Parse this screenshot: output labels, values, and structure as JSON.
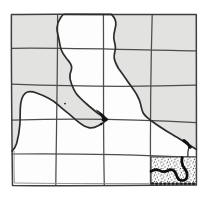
{
  "figure": {
    "canvas": {
      "width": 209,
      "height": 199
    },
    "grid": {
      "columns": 4,
      "rows": 5
    },
    "colors": {
      "page": "#ffffff",
      "shading": "#e2e2e0",
      "region_fill": "#fdfdfd",
      "grid_line": "#4c4c4c",
      "border_line": "#3e3e3e",
      "faint_line": "#8a8a8a",
      "outline": "#2c2c2c",
      "ink": "#111111",
      "stipple_dot": "#1c1c1c"
    },
    "stipple_pattern": {
      "tile": 6.5,
      "dots": [
        [
          1.2,
          1.8,
          0.6
        ],
        [
          4.4,
          0.9,
          0.5
        ],
        [
          5.9,
          3.4,
          0.6
        ],
        [
          2.6,
          4.6,
          0.55
        ],
        [
          5.1,
          5.9,
          0.6
        ],
        [
          0.7,
          6.1,
          0.45
        ]
      ]
    },
    "layers": [
      {
        "name": "shaded-background",
        "tag": "path",
        "attrs": {
          "d": "M 11.4 14.6 C 60 13.7 150 15.1 196.3 14.4 C 196.8 60 196.5 125 196.4 185.1 C 135 185.5 60 186 12.5 185.4 C 11.8 128 11.2 70 11.4 14.6 Z",
          "fill": "#e2e2e0",
          "stroke": "none"
        }
      },
      {
        "name": "region-fill",
        "tag": "path",
        "attrs": {
          "d": "M 64 14.3 C 71 14.3 104 14.4 111.5 14.4 C 113.5 16.5 116.5 20.5 115.8 25 C 115.2 29.5 113.5 33.5 113.8 38 C 114.1 42 115.8 45 115.4 48.5 C 115 52 113.8 54.5 114.2 58 C 114.8 62 116.5 65 118.5 68.5 C 121.5 72.5 125 77.5 128.8 83 C 132 87.5 135.2 91.8 137.2 95.5 C 139 98.8 140.2 101.8 140.8 104.8 C 141.4 107.8 141.6 110.3 143.2 113 C 145.4 116.6 147.8 118.1 152 121.3 C 157 125.1 162.2 128.4 167.2 131.5 C 172 134.4 176.7 137 181 139.8 C 185 142.4 190.7 146 196.5 149.4 L 196.4 185.1 L 12.5 185.4 L 12.1 151.2 C 13.6 149.6 15.6 146.6 16.7 143.2 C 18.3 137.6 19.4 130.6 19.9 124.2 C 20.3 118.6 20.1 112.6 20.3 108.4 C 20.5 102.4 21.9 95.9 25.4 93.1 C 28.6 90.6 32.6 91.6 36.6 93 C 40.6 94.4 44.6 96.2 48.6 98.2 C 52.2 100 55.7 102.6 58.7 105.4 C 61.2 107.7 63.7 109.8 66.7 112.1 C 70.7 115.1 74.3 118.6 78.3 121.8 C 81.9 124.6 85.4 127 88.9 127.7 C 92.4 128.4 95.6 127.2 98.6 125.5 C 101.6 123.7 104.9 121.7 107.7 119.4 C 104.9 118 101.6 116 98.6 113.8 C 94.6 110.8 90.1 107 86.1 103.5 C 82.6 100.4 78.7 97 76.2 93.5 C 74 90.4 72.7 87.2 71.5 84 C 70.4 81 69.5 77.7 70 74.5 C 70.5 71.8 72.1 69.5 71.6 66.5 C 71.1 63.4 68.7 61.2 66.7 58.7 C 64.5 56 62.2 52.7 61 49.2 C 59.8 45.6 59.5 41.7 58.6 37.7 C 57.9 34.5 56.7 31.2 57 27.7 C 57.3 24.2 59.1 19.7 60.9 17.2 C 61.9 15.8 63 14.6 64 14.3 Z",
          "fill": "#fdfdfd",
          "stroke": "none"
        }
      },
      {
        "name": "grid-line-vertical-1",
        "tag": "path",
        "attrs": {
          "d": "M 57.6 14.4 C 57.7 70 56.2 140 55.8 185.2",
          "fill": "none",
          "stroke": "#4c4c4c",
          "stroke-width": "1.25"
        }
      },
      {
        "name": "grid-line-vertical-2",
        "tag": "path",
        "attrs": {
          "d": "M 103.4 14.4 C 103.8 62 103 132 104.3 185.1",
          "fill": "none",
          "stroke": "#4c4c4c",
          "stroke-width": "1.25"
        }
      },
      {
        "name": "grid-line-vertical-3",
        "tag": "path",
        "attrs": {
          "d": "M 152.2 14.6 C 150.9 62 150.2 122 150.5 185",
          "fill": "none",
          "stroke": "#4c4c4c",
          "stroke-width": "1.25"
        }
      },
      {
        "name": "grid-line-horizontal-1",
        "tag": "path",
        "attrs": {
          "d": "M 11.5 48.3 C 70 47.5 140 50.2 196.4 50.9",
          "fill": "none",
          "stroke": "#4c4c4c",
          "stroke-width": "1.25"
        }
      },
      {
        "name": "grid-line-horizontal-2",
        "tag": "path",
        "attrs": {
          "d": "M 11.4 84.2 C 70 86.4 140 87 196.4 85.2",
          "fill": "none",
          "stroke": "#4c4c4c",
          "stroke-width": "1.25"
        }
      },
      {
        "name": "grid-line-horizontal-3",
        "tag": "path",
        "attrs": {
          "d": "M 11.4 120.2 C 65 118.3 125 118.4 196.4 122.6",
          "fill": "none",
          "stroke": "#4c4c4c",
          "stroke-width": "1.25"
        }
      },
      {
        "name": "grid-line-horizontal-4",
        "tag": "path",
        "attrs": {
          "d": "M 11.5 154 C 70 153.3 130 154.6 196.4 157.3",
          "fill": "none",
          "stroke": "#4c4c4c",
          "stroke-width": "1.25"
        }
      },
      {
        "name": "map-border",
        "tag": "path",
        "attrs": {
          "d": "M 11.4 14.6 C 60 13.7 150 15.1 196.3 14.4 C 196.8 60 196.5 125 196.4 185.1 C 135 185.5 60 186 12.5 185.4 C 11.8 128 11.2 70 11.4 14.6 Z",
          "fill": "none",
          "stroke": "#3e3e3e",
          "stroke-width": "1.5",
          "stroke-linejoin": "round"
        }
      },
      {
        "name": "map-border-double-stroke",
        "tag": "path",
        "attrs": {
          "d": "M 14.1 151 C 13.9 163 14 174 14.4 183 C 58 183.8 105 183.4 149.5 183.6",
          "fill": "none",
          "stroke": "#8a8a8a",
          "stroke-width": "0.9"
        }
      },
      {
        "name": "region-outline",
        "tag": "path",
        "attrs": {
          "d": "M 64 14.3 C 71 14.3 104 14.4 111.5 14.4 C 113.5 16.5 116.5 20.5 115.8 25 C 115.2 29.5 113.5 33.5 113.8 38 C 114.1 42 115.8 45 115.4 48.5 C 115 52 113.8 54.5 114.2 58 C 114.8 62 116.5 65 118.5 68.5 C 121.5 72.5 125 77.5 128.8 83 C 132 87.5 135.2 91.8 137.2 95.5 C 139 98.8 140.2 101.8 140.8 104.8 C 141.4 107.8 141.6 110.3 143.2 113 C 145.4 116.6 147.8 118.1 152 121.3 C 157 125.1 162.2 128.4 167.2 131.5 C 172 134.4 176.7 137 181 139.8 C 185 142.4 190.7 146 196.5 149.4 M 12.1 151.2 C 13.6 149.6 15.6 146.6 16.7 143.2 C 18.3 137.6 19.4 130.6 19.9 124.2 C 20.3 118.6 20.1 112.6 20.3 108.4 C 20.5 102.4 21.9 95.9 25.4 93.1 C 28.6 90.6 32.6 91.6 36.6 93 C 40.6 94.4 44.6 96.2 48.6 98.2 C 52.2 100 55.7 102.6 58.7 105.4 C 61.2 107.7 63.7 109.8 66.7 112.1 C 70.7 115.1 74.3 118.6 78.3 121.8 C 81.9 124.6 85.4 127 88.9 127.7 C 92.4 128.4 95.6 127.2 98.6 125.5 C 101.6 123.7 104.9 121.7 107.7 119.4 C 104.9 118 101.6 116 98.6 113.8 C 94.6 110.8 90.1 107 86.1 103.5 C 82.6 100.4 78.7 97 76.2 93.5 C 74 90.4 72.7 87.2 71.5 84 C 70.4 81 69.5 77.7 70 74.5 C 70.5 71.8 72.1 69.5 71.6 66.5 C 71.1 63.4 68.7 61.2 66.7 58.7 C 64.5 56 62.2 52.7 61 49.2 C 59.8 45.6 59.5 41.7 58.6 37.7 C 57.9 34.5 56.7 31.2 57 27.7 C 57.3 24.2 59.1 19.7 60.9 17.2 C 61.9 15.8 63 14.6 64 14.3",
          "fill": "none",
          "stroke": "#2c2c2c",
          "stroke-width": "1.7",
          "stroke-linejoin": "round",
          "stroke-linecap": "round"
        }
      },
      {
        "name": "stipple-cell-underlay",
        "tag": "rect",
        "attrs": {
          "x": "151",
          "y": "156.9",
          "width": "45.3",
          "height": "26.9",
          "fill": "#ffffff",
          "stroke": "none"
        }
      },
      {
        "name": "stipple-cell-dots",
        "tag": "rect",
        "attrs": {
          "x": "151",
          "y": "156.9",
          "width": "45.3",
          "height": "26.9",
          "fill": "url(#stipple)",
          "stroke": "none"
        }
      },
      {
        "name": "stipple-cell-outline",
        "tag": "rect",
        "attrs": {
          "x": "151",
          "y": "156.9",
          "width": "45.3",
          "height": "26.9",
          "fill": "none",
          "stroke": "#3f3f3f",
          "stroke-width": "1.1"
        }
      },
      {
        "name": "channel-squiggle",
        "tag": "path",
        "attrs": {
          "d": "M 151 171.4 C 154 169.2 157 169 160 170.6 C 162.5 171.9 165 172 167.5 170.7 C 169.8 169.5 172.2 169.3 174.1 170.9 C 175.9 172.4 176.3 174.8 177.2 177 C 178.1 179.2 180.2 180.6 182.6 180.5 C 185.1 180.4 186.8 178.6 187.1 176.1 C 187.4 173.4 186.2 170.6 184.5 168.4 C 183.1 166.5 182.1 164.3 181.9 162 C 181.7 160.5 181.9 159 182.1 157.7",
          "fill": "none",
          "stroke": "#0d0d0d",
          "stroke-width": "2.7",
          "stroke-linecap": "round",
          "stroke-linejoin": "round"
        }
      },
      {
        "name": "stipple-cell-bottom-band",
        "tag": "path",
        "attrs": {
          "d": "M 151.2 183.4 C 166 184 181 183.4 195.8 183.8",
          "fill": "none",
          "stroke": "#161616",
          "stroke-width": "2.3",
          "stroke-dasharray": "2.6 1.5"
        }
      },
      {
        "name": "boundary-connector-line",
        "tag": "path",
        "attrs": {
          "d": "M 188.9 146.8 C 188 150.2 187.6 153.4 187.8 157",
          "fill": "none",
          "stroke": "#333333",
          "stroke-width": "1.3"
        }
      },
      {
        "name": "boundary-ink-mark",
        "tag": "path",
        "attrs": {
          "d": "M 183.9 140.6 C 186.6 142.3 188.8 144.5 190.3 147.2",
          "fill": "none",
          "stroke": "#111111",
          "stroke-width": "3.1",
          "stroke-linecap": "round"
        }
      },
      {
        "name": "tongue-tip-ink-crescent",
        "tag": "path",
        "attrs": {
          "d": "M 96.5 110.2 C 100.9 112.4 104.8 115.7 107.6 119.6 C 105.9 120.9 103.9 121.4 102.1 120.9 C 103.3 117.7 100.4 113.4 96.5 110.2 Z",
          "fill": "#111111",
          "stroke": "#111111",
          "stroke-width": "0.8",
          "stroke-linejoin": "round"
        }
      },
      {
        "name": "tip-ink-dot",
        "tag": "circle",
        "attrs": {
          "cx": "101.2",
          "cy": "124.2",
          "r": "1.15",
          "fill": "#111111"
        }
      },
      {
        "name": "arc-ink-tick",
        "tag": "circle",
        "attrs": {
          "cx": "65",
          "cy": "103.6",
          "r": "0.9",
          "fill": "#222222"
        }
      }
    ]
  }
}
